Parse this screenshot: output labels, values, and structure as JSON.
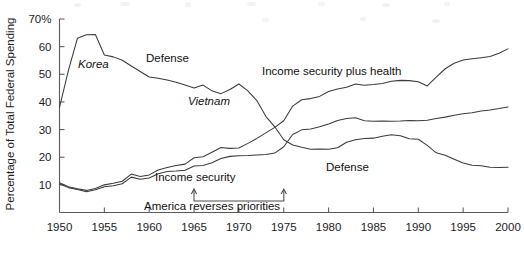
{
  "chart_data": {
    "type": "line",
    "title": "",
    "xlabel": "",
    "ylabel": "Percentage of Total Federal Spending",
    "xlim": [
      1950,
      2000
    ],
    "ylim": [
      0,
      70
    ],
    "grid": false,
    "legend_position": "inline-annotations",
    "y_ticks": [
      {
        "value": 70,
        "label": "70%"
      },
      {
        "value": 60,
        "label": "60"
      },
      {
        "value": 50,
        "label": "50"
      },
      {
        "value": 40,
        "label": "40"
      },
      {
        "value": 30,
        "label": "30"
      },
      {
        "value": 20,
        "label": "20"
      },
      {
        "value": 10,
        "label": "10"
      }
    ],
    "x_ticks": [
      {
        "value": 1950,
        "label": "1950"
      },
      {
        "value": 1955,
        "label": "1955"
      },
      {
        "value": 1960,
        "label": "1960"
      },
      {
        "value": 1965,
        "label": "1965"
      },
      {
        "value": 1970,
        "label": "1970"
      },
      {
        "value": 1975,
        "label": "1975"
      },
      {
        "value": 1980,
        "label": "1980"
      },
      {
        "value": 1985,
        "label": "1985"
      },
      {
        "value": 1990,
        "label": "1990"
      },
      {
        "value": 1995,
        "label": "1995"
      },
      {
        "value": 2000,
        "label": "2000"
      }
    ],
    "x": [
      1950,
      1951,
      1952,
      1953,
      1954,
      1955,
      1956,
      1957,
      1958,
      1959,
      1960,
      1961,
      1962,
      1963,
      1964,
      1965,
      1966,
      1967,
      1968,
      1969,
      1970,
      1971,
      1972,
      1973,
      1974,
      1975,
      1976,
      1977,
      1978,
      1979,
      1980,
      1981,
      1982,
      1983,
      1984,
      1985,
      1986,
      1987,
      1988,
      1989,
      1990,
      1991,
      1992,
      1993,
      1994,
      1995,
      1996,
      1997,
      1998,
      1999,
      2000
    ],
    "series": [
      {
        "name": "Defense",
        "values": [
          38.0,
          51.5,
          63.0,
          64.3,
          64.4,
          57.0,
          56.3,
          55.1,
          53.0,
          51.0,
          49.0,
          48.6,
          47.9,
          47.1,
          46.1,
          45.0,
          46.1,
          44.0,
          43.0,
          44.5,
          46.5,
          44.0,
          40.5,
          34.8,
          31.0,
          26.3,
          24.4,
          23.6,
          22.9,
          23.0,
          22.9,
          23.4,
          25.4,
          26.3,
          26.8,
          26.9,
          27.6,
          28.1,
          27.8,
          26.7,
          26.5,
          24.3,
          21.6,
          20.7,
          19.3,
          17.9,
          17.1,
          16.9,
          16.4,
          16.3,
          16.4
        ],
        "style": "solid",
        "label_positions": [
          "1958 upper-curve",
          "1982 lower-curve"
        ]
      },
      {
        "name": "Income security",
        "values": [
          10.3,
          9.0,
          8.3,
          7.5,
          8.2,
          9.3,
          9.7,
          10.4,
          12.8,
          12.0,
          12.5,
          14.0,
          14.8,
          15.0,
          15.3,
          16.8,
          17.0,
          18.0,
          19.5,
          20.3,
          20.5,
          20.6,
          20.8,
          21.0,
          21.5,
          23.8,
          28.2,
          29.9,
          30.2,
          31.0,
          32.0,
          33.3,
          34.0,
          34.3,
          33.2,
          33.0,
          33.1,
          33.0,
          33.1,
          33.3,
          33.2,
          33.4,
          34.0,
          34.5,
          35.2,
          35.7,
          36.1,
          36.7,
          37.1,
          37.6,
          38.2
        ],
        "style": "solid"
      },
      {
        "name": "Income security plus health",
        "values": [
          10.8,
          9.3,
          8.6,
          8.0,
          8.7,
          10.0,
          10.6,
          11.3,
          13.9,
          13.0,
          13.6,
          15.4,
          16.3,
          17.0,
          17.5,
          19.8,
          20.2,
          21.8,
          23.5,
          23.2,
          23.3,
          25.0,
          26.8,
          28.8,
          30.8,
          33.2,
          38.5,
          40.8,
          41.2,
          42.0,
          43.8,
          44.7,
          45.3,
          46.5,
          46.0,
          46.3,
          46.7,
          47.5,
          47.8,
          47.7,
          47.3,
          45.8,
          49.0,
          52.0,
          54.0,
          55.2,
          55.6,
          56.0,
          56.4,
          57.6,
          59.2
        ],
        "style": "solid"
      }
    ],
    "annotations": [
      {
        "id": "korea",
        "text": "Korea",
        "style": "italic",
        "x_px": 78,
        "y_px": 68
      },
      {
        "id": "defense-upper",
        "text": "Defense",
        "style": "roman",
        "x_px": 146,
        "y_px": 62
      },
      {
        "id": "vietnam",
        "text": "Vietnam",
        "style": "italic",
        "x_px": 188,
        "y_px": 105
      },
      {
        "id": "income-security-plus-health",
        "text": "Income security plus health",
        "style": "roman",
        "x_px": 262,
        "y_px": 75
      },
      {
        "id": "income-security",
        "text": "Income security",
        "style": "roman",
        "x_px": 155,
        "y_px": 181
      },
      {
        "id": "defense-lower",
        "text": "Defense",
        "style": "roman",
        "x_px": 326,
        "y_px": 171
      },
      {
        "id": "america-reverses-priorities",
        "text": "America reverses priorities",
        "style": "roman",
        "x_px": 144,
        "y_px": 210
      }
    ],
    "bracket_annotation": {
      "label": "America reverses priorities",
      "x_start_year": 1965,
      "x_end_year": 1975,
      "arrow_direction": "up"
    }
  },
  "colors": {
    "line": "#3b3b3b",
    "axis": "#5a5a5a",
    "text": "#1c1c1c",
    "background": "#ffffff"
  }
}
